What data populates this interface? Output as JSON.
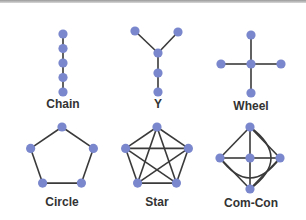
{
  "diagram": {
    "colors": {
      "node": "#7a87cc",
      "edge": "#3a3a3a",
      "label": "#333333"
    },
    "networks": [
      {
        "id": "chain",
        "label": "Chain",
        "nodes": [
          [
            0,
            0
          ],
          [
            0,
            1
          ],
          [
            0,
            2
          ],
          [
            0,
            3
          ],
          [
            0,
            4
          ]
        ],
        "edges": [
          [
            0,
            1
          ],
          [
            1,
            2
          ],
          [
            2,
            3
          ],
          [
            3,
            4
          ]
        ]
      },
      {
        "id": "y",
        "label": "Y",
        "nodes": [
          [
            -1,
            0
          ],
          [
            1,
            0
          ],
          [
            0,
            1
          ],
          [
            0,
            2
          ],
          [
            0,
            3
          ]
        ],
        "edges": [
          [
            0,
            2
          ],
          [
            1,
            2
          ],
          [
            2,
            3
          ],
          [
            3,
            4
          ]
        ]
      },
      {
        "id": "wheel",
        "label": "Wheel",
        "nodes": [
          [
            0,
            -1
          ],
          [
            -1,
            0
          ],
          [
            0,
            0
          ],
          [
            1,
            0
          ],
          [
            0,
            1
          ]
        ],
        "edges": [
          [
            0,
            2
          ],
          [
            1,
            2
          ],
          [
            3,
            2
          ],
          [
            4,
            2
          ]
        ]
      },
      {
        "id": "circle",
        "label": "Circle",
        "nodes": [
          [
            0,
            -1
          ],
          [
            -0.951,
            -0.309
          ],
          [
            0.951,
            -0.309
          ],
          [
            -0.588,
            0.809
          ],
          [
            0.588,
            0.809
          ]
        ],
        "edges": [
          [
            0,
            1
          ],
          [
            0,
            2
          ],
          [
            1,
            3
          ],
          [
            2,
            4
          ],
          [
            3,
            4
          ]
        ]
      },
      {
        "id": "star",
        "label": "Star",
        "nodes": [
          [
            0,
            -1
          ],
          [
            -0.951,
            -0.309
          ],
          [
            0.951,
            -0.309
          ],
          [
            -0.588,
            0.809
          ],
          [
            0.588,
            0.809
          ]
        ],
        "edges": [
          [
            0,
            1
          ],
          [
            0,
            2
          ],
          [
            1,
            3
          ],
          [
            2,
            4
          ],
          [
            3,
            4
          ],
          [
            0,
            3
          ],
          [
            0,
            4
          ],
          [
            1,
            2
          ],
          [
            1,
            4
          ],
          [
            2,
            3
          ]
        ]
      },
      {
        "id": "comcon",
        "label": "Com-Con",
        "nodes": [
          [
            0,
            -1
          ],
          [
            -1,
            0
          ],
          [
            0,
            0
          ],
          [
            1,
            0
          ],
          [
            0,
            1
          ]
        ],
        "edges": [
          [
            0,
            1
          ],
          [
            0,
            3
          ],
          [
            1,
            4
          ],
          [
            3,
            4
          ],
          [
            0,
            2
          ],
          [
            1,
            2
          ],
          [
            2,
            3
          ],
          [
            2,
            4
          ]
        ],
        "curved_edges": [
          [
            0,
            4
          ],
          [
            1,
            3
          ]
        ]
      }
    ]
  }
}
